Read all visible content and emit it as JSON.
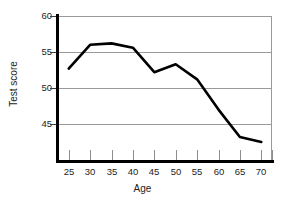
{
  "chart_data": {
    "type": "line",
    "title": "",
    "xlabel": "Age",
    "ylabel": "Test score",
    "x": [
      25,
      30,
      35,
      40,
      45,
      50,
      55,
      60,
      65,
      70
    ],
    "values": [
      52.7,
      56.0,
      56.2,
      55.6,
      52.2,
      53.3,
      51.2,
      47.0,
      43.2,
      42.5
    ],
    "series": [
      {
        "name": "Test score",
        "values": [
          52.7,
          56.0,
          56.2,
          55.6,
          52.2,
          53.3,
          51.2,
          47.0,
          43.2,
          42.5
        ]
      }
    ],
    "xlim": [
      22.5,
      72.5
    ],
    "ylim": [
      40.0,
      60.0
    ],
    "xticks": [
      25,
      30,
      35,
      40,
      45,
      50,
      55,
      60,
      65,
      70
    ],
    "xtick_labels": [
      "25",
      "30",
      "35",
      "40",
      "45",
      "50",
      "55",
      "60",
      "65",
      "70"
    ],
    "yticks": [
      45,
      50,
      55,
      60
    ],
    "ytick_labels": [
      "45",
      "50",
      "55",
      "60"
    ],
    "grid": "horizontal",
    "legend": "none",
    "line_color": "#000000",
    "grid_color": "#9a9a9a",
    "axis_color": "#000000",
    "background": "#ffffff"
  },
  "axes": {
    "y_title": "Test score",
    "x_title": "Age"
  }
}
